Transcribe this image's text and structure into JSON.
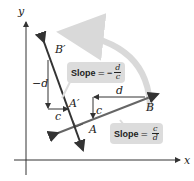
{
  "diagram": {
    "axes": {
      "x_label": "x",
      "y_label": "y"
    },
    "points": {
      "A": "A",
      "B": "B",
      "A_prime": "A′",
      "B_prime": "B′"
    },
    "run_rise": {
      "d": "d",
      "c": "c",
      "neg_d": "−d",
      "c2": "c"
    },
    "slope1": {
      "label": "Slope",
      "eq": "=",
      "sign": "",
      "num": "c",
      "den": "d"
    },
    "slope2": {
      "label": "Slope",
      "eq": "=",
      "sign": "−",
      "num": "d",
      "den": "c"
    },
    "colors": {
      "line": "#555555",
      "dark_line": "#222222",
      "box": "#dcdcdc",
      "arrow_curve": "#d9d9d9"
    }
  }
}
